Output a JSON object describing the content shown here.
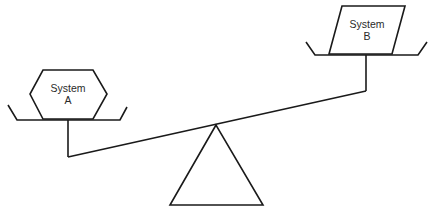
{
  "diagram": {
    "type": "balance-scale",
    "systems": [
      {
        "id": "a",
        "line1": "System",
        "line2": "A",
        "shape": "hexagon",
        "side": "left",
        "position": "lower"
      },
      {
        "id": "b",
        "line1": "System",
        "line2": "B",
        "shape": "parallelogram",
        "side": "right",
        "position": "higher"
      }
    ],
    "colors": {
      "stroke": "#1a1a1a",
      "background": "#ffffff",
      "text": "#2a2a2a"
    }
  }
}
